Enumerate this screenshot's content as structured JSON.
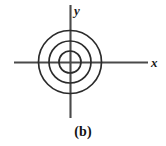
{
  "figure": {
    "caption": "(b)",
    "background_color": "#ffffff",
    "stroke_color": "#2b2b2b",
    "axis_color": "#4a4a4a",
    "axes": {
      "x_label": "x",
      "y_label": "y",
      "origin_x": 70,
      "origin_y": 62,
      "x_start": 14,
      "x_end": 148,
      "y_start": 5,
      "y_end": 118
    }
  },
  "chart_data": {
    "type": "scatter",
    "title": "(b)",
    "subtitle": "",
    "xlabel": "x",
    "ylabel": "y",
    "xlim": [
      -3.6,
      3.6
    ],
    "ylim": [
      -3.1,
      3.1
    ],
    "grid": false,
    "legend": "none",
    "series": [
      {
        "name": "orbit-inner",
        "shape": "circle",
        "center": [
          0,
          0
        ],
        "radius": 1.0,
        "pixel_center": [
          70,
          62
        ],
        "pixel_radius": 11
      },
      {
        "name": "orbit-middle",
        "shape": "circle",
        "center": [
          0,
          0
        ],
        "radius": 2.0,
        "pixel_center": [
          70,
          62
        ],
        "pixel_radius": 21
      },
      {
        "name": "orbit-outer",
        "shape": "circle",
        "center": [
          0,
          0
        ],
        "radius": 3.0,
        "pixel_center": [
          70,
          62
        ],
        "pixel_radius": 31.5
      }
    ],
    "annotations": [
      {
        "text": "x",
        "position": "x-axis-end",
        "style": "italic"
      },
      {
        "text": "y",
        "position": "y-axis-top",
        "style": "italic"
      },
      {
        "text": "(b)",
        "position": "below-figure",
        "style": "bold"
      }
    ]
  }
}
